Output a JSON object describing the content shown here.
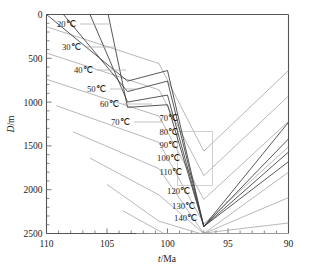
{
  "figure": {
    "type": "burial-history-diagram",
    "background": "#ffffff",
    "curve_color": "#3a3a3a",
    "isotherm_color": "#9a9a9a"
  },
  "chart_data": {
    "type": "line",
    "title": "",
    "subtitle": "",
    "xlabel": "t/Ma",
    "ylabel": "D/m",
    "xlabel_symbol": "t",
    "xlabel_unit": "/Ma",
    "ylabel_symbol": "D",
    "ylabel_unit": "/m",
    "xlim": [
      110,
      90
    ],
    "ylim": [
      2500,
      0
    ],
    "x_axis_reversed": true,
    "y_axis_reversed": true,
    "grid": false,
    "legend": "none",
    "xticks": [
      110,
      105,
      100,
      95,
      90
    ],
    "xticklabels": [
      "110",
      "105",
      "100",
      "95",
      "90"
    ],
    "xtick_minor_step": 1,
    "yticks": [
      0,
      500,
      1000,
      1500,
      2000,
      2500
    ],
    "yticklabels": [
      "0",
      "500",
      "1000",
      "1500",
      "2000",
      "2500"
    ],
    "ytick_minor_step": 100,
    "series": [
      {
        "name": "horizon-1",
        "kind": "burial-curve",
        "x": [
          110.0,
          103.3,
          100.0,
          97.0,
          90.0
        ],
        "y": [
          0,
          760,
          640,
          2420,
          1230
        ]
      },
      {
        "name": "horizon-2",
        "kind": "burial-curve",
        "x": [
          108.6,
          103.3,
          100.0,
          97.0,
          90.0
        ],
        "y": [
          0,
          880,
          760,
          2420,
          1420
        ]
      },
      {
        "name": "horizon-3",
        "kind": "burial-curve",
        "x": [
          106.4,
          103.3,
          100.0,
          97.0,
          90.0
        ],
        "y": [
          0,
          1000,
          920,
          2420,
          1570
        ]
      },
      {
        "name": "horizon-4",
        "kind": "burial-curve",
        "x": [
          104.9,
          103.3,
          100.0,
          97.0,
          90.0
        ],
        "y": [
          0,
          1060,
          1030,
          2420,
          1680
        ]
      }
    ],
    "isotherms": [
      {
        "label": "20℃",
        "value": 20,
        "x": [
          110.0,
          100.7,
          97.0,
          90.0
        ],
        "y": [
          140,
          560,
          1560,
          640
        ]
      },
      {
        "label": "30℃",
        "value": 30,
        "x": [
          110.0,
          100.7,
          97.0,
          90.0
        ],
        "y": [
          440,
          860,
          1840,
          930
        ]
      },
      {
        "label": "40℃",
        "value": 40,
        "x": [
          110.0,
          100.7,
          97.0,
          90.0
        ],
        "y": [
          740,
          1160,
          2110,
          1220
        ]
      },
      {
        "label": "50℃",
        "value": 50,
        "x": [
          109.2,
          100.7,
          97.0,
          90.0
        ],
        "y": [
          1040,
          1460,
          2390,
          1510
        ]
      },
      {
        "label": "60℃",
        "value": 60,
        "x": [
          107.8,
          100.7,
          97.0,
          90.0
        ],
        "y": [
          1340,
          1760,
          2500,
          1800
        ]
      },
      {
        "label": "70℃",
        "value": 70,
        "x": [
          106.4,
          100.7,
          97.0,
          90.0
        ],
        "y": [
          1640,
          2060,
          2500,
          2090
        ]
      },
      {
        "label": "80℃",
        "value": 80,
        "x": [
          105.0,
          100.7,
          97.3,
          90.0
        ],
        "y": [
          1940,
          2360,
          2500,
          2380
        ]
      },
      {
        "label": "90℃",
        "value": 90,
        "x": [
          103.7,
          100.3,
          97.4,
          90.0
        ],
        "y": [
          2240,
          2500,
          2500,
          2500
        ]
      },
      {
        "label": "100℃",
        "value": 100,
        "x": [
          102.6,
          99.9,
          97.5,
          90.0
        ],
        "y": [
          2500,
          2500,
          2500,
          2500
        ]
      },
      {
        "label": "110℃",
        "value": 110,
        "x": [
          101.6,
          99.5,
          97.6,
          90.0
        ],
        "y": [
          2500,
          2500,
          2500,
          2500
        ]
      },
      {
        "label": "120℃",
        "value": 120,
        "x": [
          100.7,
          99.1,
          97.7,
          90.0
        ],
        "y": [
          2500,
          2500,
          2500,
          2500
        ]
      },
      {
        "label": "130℃",
        "value": 130,
        "x": [
          99.8,
          98.7,
          97.8,
          90.0
        ],
        "y": [
          2500,
          2500,
          2500,
          2500
        ]
      },
      {
        "label": "140℃",
        "value": 140,
        "x": [
          98.9,
          98.3,
          97.9,
          90.0
        ],
        "y": [
          2500,
          2500,
          2500,
          2500
        ]
      }
    ],
    "isotherm_labels_left": [
      {
        "text": "20℃",
        "px": 57,
        "py": 27
      },
      {
        "text": "30℃",
        "px": 62,
        "py": 50
      },
      {
        "text": "40℃",
        "px": 74,
        "py": 73
      },
      {
        "text": "50℃",
        "px": 87,
        "py": 92
      },
      {
        "text": "60℃",
        "px": 100,
        "py": 107
      },
      {
        "text": "70℃",
        "px": 111,
        "py": 125
      }
    ],
    "isotherm_labels_right": [
      {
        "text": "70℃",
        "px": 178,
        "py": 121
      },
      {
        "text": "80℃",
        "px": 178,
        "py": 135
      },
      {
        "text": "90℃",
        "px": 178,
        "py": 148
      },
      {
        "text": "100℃",
        "px": 180,
        "py": 161
      },
      {
        "text": "110℃",
        "px": 182,
        "py": 175
      },
      {
        "text": "120℃",
        "px": 190,
        "py": 194
      },
      {
        "text": "130℃",
        "px": 195,
        "py": 209
      },
      {
        "text": "140℃",
        "px": 197,
        "py": 221
      }
    ]
  }
}
